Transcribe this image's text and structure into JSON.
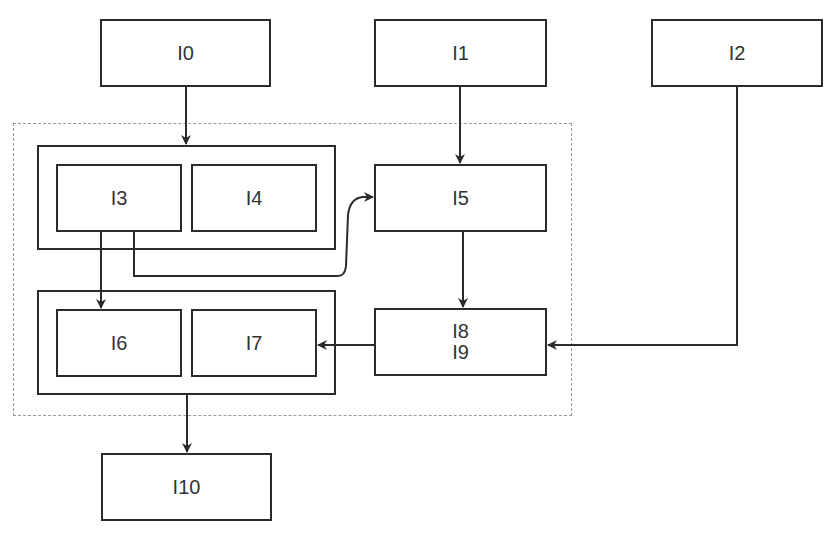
{
  "diagram": {
    "type": "block-diagram",
    "nodes": {
      "I0": {
        "label": "I0"
      },
      "I1": {
        "label": "I1"
      },
      "I2": {
        "label": "I2"
      },
      "I3": {
        "label": "I3"
      },
      "I4": {
        "label": "I4"
      },
      "I5": {
        "label": "I5"
      },
      "I6": {
        "label": "I6"
      },
      "I7": {
        "label": "I7"
      },
      "I8": {
        "label": "I8"
      },
      "I9": {
        "label": "I9"
      },
      "I10": {
        "label": "I10"
      }
    },
    "groups": [
      {
        "id": "group-top",
        "members": [
          "I3",
          "I4"
        ]
      },
      {
        "id": "group-bottom",
        "members": [
          "I6",
          "I7"
        ]
      },
      {
        "id": "dashed-region",
        "members": [
          "group-top",
          "group-bottom",
          "I5",
          "I8",
          "I9"
        ],
        "style": "dashed"
      }
    ],
    "edges": [
      {
        "from": "I0",
        "to": "group-top"
      },
      {
        "from": "I1",
        "to": "I5"
      },
      {
        "from": "I3",
        "to": "I6"
      },
      {
        "from": "I3",
        "to": "I5",
        "style": "curved"
      },
      {
        "from": "I5",
        "to": "I8/I9"
      },
      {
        "from": "I8/I9",
        "to": "I7"
      },
      {
        "from": "I2",
        "to": "I8/I9"
      },
      {
        "from": "group-bottom",
        "to": "I10"
      }
    ],
    "colors": {
      "stroke": "#2b2b2b",
      "dashed": "#9a9a9a",
      "text": "#333333",
      "background": "#ffffff"
    }
  }
}
